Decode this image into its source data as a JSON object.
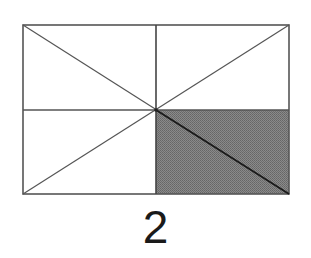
{
  "figure": {
    "rect": {
      "x": 23,
      "y": 25,
      "width": 266,
      "height": 169
    },
    "center": {
      "x": 156,
      "y": 110
    },
    "line_color": "#555555",
    "shade_color": "#7a7a7a",
    "shaded_region": "bottom-right quadrant",
    "parts_total": 8,
    "parts_shaded": 2
  },
  "caption": {
    "label": "2"
  }
}
